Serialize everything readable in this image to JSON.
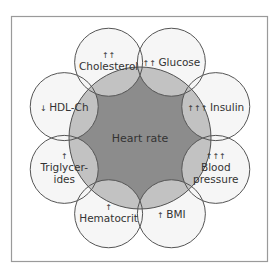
{
  "center": {
    "label": "Heart rate"
  },
  "factors": [
    {
      "arrows": "↑↑",
      "lines": [
        "Cholesterol"
      ]
    },
    {
      "arrows": "↑↑",
      "lines": [
        "Glucose"
      ]
    },
    {
      "arrows": "↑↑↑",
      "lines": [
        "Insulin"
      ]
    },
    {
      "arrows": "↑↑↑",
      "lines": [
        "Blood",
        "pressure"
      ]
    },
    {
      "arrows": "↑",
      "lines": [
        "BMI"
      ]
    },
    {
      "arrows": "↑",
      "lines": [
        "Hematocrit"
      ]
    },
    {
      "arrows": "↑",
      "lines": [
        "Triglycer-",
        "ides"
      ]
    },
    {
      "arrows": "↓",
      "lines": [
        "HDL-Ch"
      ]
    }
  ],
  "colors": {
    "center_fill": "#8c8c8c",
    "overlap_fill": "#c2c2c2",
    "outer_fill": "#f6f6f6",
    "stroke": "#555555",
    "frame": "#9a9a9a"
  }
}
